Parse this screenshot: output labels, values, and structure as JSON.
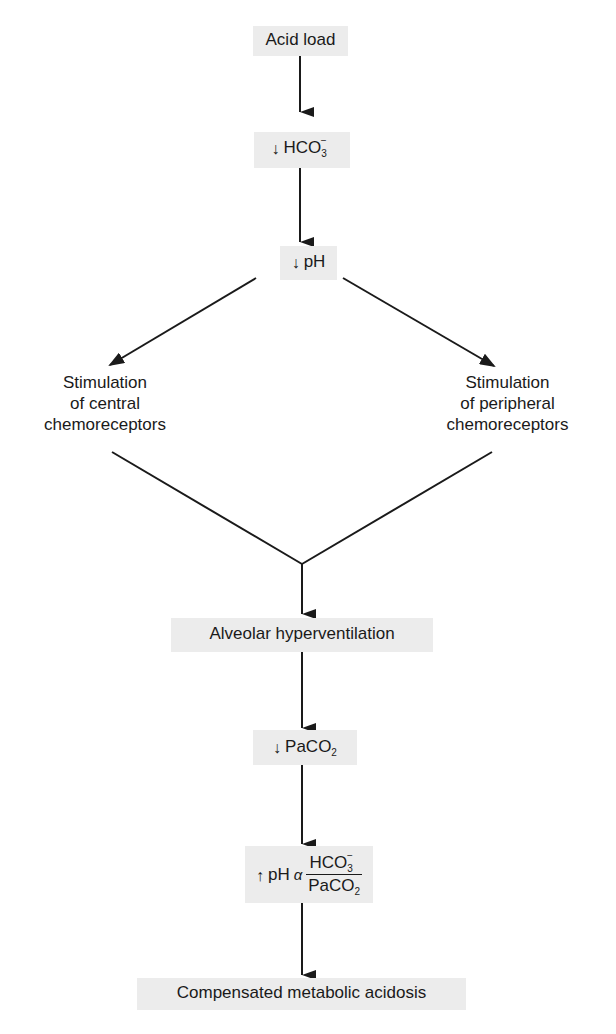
{
  "diagram": {
    "nodes": {
      "acid_load": {
        "label": "Acid load"
      },
      "hco3": {
        "prefix_icon": "down-arrow",
        "prefix": "↓",
        "label": "HCO",
        "sub": "3",
        "sup": "−"
      },
      "ph1": {
        "prefix_icon": "down-arrow",
        "prefix": "↓",
        "label": "pH"
      },
      "central": {
        "lines": [
          "Stimulation",
          "of central",
          "chemoreceptors"
        ]
      },
      "peripheral": {
        "lines": [
          "Stimulation",
          "of peripheral",
          "chemoreceptors"
        ]
      },
      "hyperventilation": {
        "label": "Alveolar hyperventilation"
      },
      "paco2": {
        "prefix_icon": "down-arrow",
        "prefix": "↓",
        "label": "PaCO",
        "sub": "2"
      },
      "ph2": {
        "prefix_icon": "up-arrow",
        "prefix": "↑",
        "label": "pH",
        "alpha": "α",
        "numerator": "HCO",
        "numerator_sub": "3",
        "numerator_sup": "−",
        "denominator": "PaCO",
        "denominator_sub": "2"
      },
      "compensated": {
        "label": "Compensated metabolic acidosis"
      }
    },
    "edges": [
      {
        "from": "acid_load",
        "to": "hco3"
      },
      {
        "from": "hco3",
        "to": "ph1"
      },
      {
        "from": "ph1",
        "to": "central"
      },
      {
        "from": "ph1",
        "to": "peripheral"
      },
      {
        "from": "central",
        "to": "hyperventilation"
      },
      {
        "from": "peripheral",
        "to": "hyperventilation"
      },
      {
        "from": "hyperventilation",
        "to": "paco2"
      },
      {
        "from": "paco2",
        "to": "ph2"
      },
      {
        "from": "ph2",
        "to": "compensated"
      }
    ],
    "colors": {
      "box_fill": "#ececec",
      "line": "#1a1a1a",
      "background": "#ffffff"
    }
  }
}
